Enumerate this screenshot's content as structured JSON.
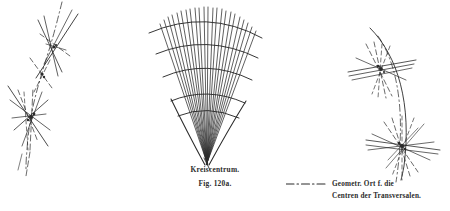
{
  "page": {
    "width": 450,
    "height": 211,
    "background_color": "#ffffff",
    "ink_color": "#262626"
  },
  "caption": {
    "title": "Kreiscentrum.",
    "figure_number": "Fig. 120a."
  },
  "legend": {
    "sample_style": "dash-dot",
    "line_1": "Geometr. Ort f. die",
    "line_2": "Centren der Transversalen."
  },
  "figures": {
    "left": {
      "name": "left-locus-figure",
      "description": "dash-dot locus curve crossed by two star clusters of transversals",
      "locus_curve": "M 60 4 L 55 30 L 48 56 L 40 80 L 34 104 L 30 128 L 27 152 L 26 168",
      "nodes": [
        {
          "x": 54,
          "y": 62,
          "rays": 7,
          "spread": 128
        },
        {
          "x": 33,
          "y": 116,
          "rays": 9,
          "spread": 150
        }
      ]
    },
    "center": {
      "name": "pencil-of-transversals-figure",
      "description": "fan of transversal lines converging to the Kreiscentrum crossed by concentric arcs",
      "apex": {
        "x": 207,
        "y": 163
      },
      "ray_count": 23,
      "angle_start": -118,
      "angle_end": -62,
      "arc_radii": [
        60,
        88,
        114,
        140,
        155
      ],
      "envelope": true
    },
    "right": {
      "name": "right-locus-figure",
      "description": "solid circle arc and dash-dot locus with two star clusters of transversals",
      "solid_arc": "M 372 28 Q 412 90 396 172",
      "dashed_arc": "M 378 36 Q 404 96 392 176",
      "nodes": [
        {
          "x": 382,
          "y": 69,
          "rays": 9,
          "spread": 170
        },
        {
          "x": 404,
          "y": 146,
          "rays": 11,
          "spread": 175
        }
      ]
    }
  }
}
